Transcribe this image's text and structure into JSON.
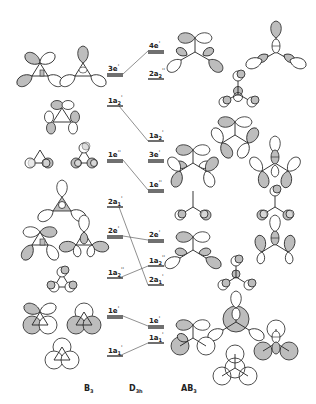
{
  "diagram": {
    "title": "",
    "column_labels": {
      "left": "B3",
      "middle": "D3h",
      "right": "AB3"
    },
    "left_levels": [
      {
        "id": "B3-3e'",
        "label": "3e'",
        "sym": "3e",
        "prime": "'",
        "degenerate": true,
        "y": 74
      },
      {
        "id": "B3-1a2'",
        "label": "1a2'",
        "sym": "1a",
        "sub": "2",
        "prime": "'",
        "degenerate": false,
        "y": 106
      },
      {
        "id": "B3-1e''",
        "label": "1e''",
        "sym": "1e",
        "prime": "''",
        "degenerate": true,
        "y": 160
      },
      {
        "id": "B3-2a1'",
        "label": "2a1'",
        "sym": "2a",
        "sub": "1",
        "prime": "'",
        "degenerate": false,
        "y": 207
      },
      {
        "id": "B3-2e'",
        "label": "2e'",
        "sym": "2e",
        "prime": "'",
        "degenerate": true,
        "y": 236
      },
      {
        "id": "B3-1a2''",
        "label": "1a2''",
        "sym": "1a",
        "sub": "2",
        "prime": "''",
        "degenerate": false,
        "y": 278
      },
      {
        "id": "B3-1e'",
        "label": "1e'",
        "sym": "1e",
        "prime": "'",
        "degenerate": true,
        "y": 316
      },
      {
        "id": "B3-1a1'",
        "label": "1a1'",
        "sym": "1a",
        "sub": "1",
        "prime": "'",
        "degenerate": false,
        "y": 356
      }
    ],
    "right_levels": [
      {
        "id": "AB3-4e'",
        "label": "4e'",
        "sym": "4e",
        "prime": "'",
        "degenerate": true,
        "y": 51
      },
      {
        "id": "AB3-2a2''",
        "label": "2a2''",
        "sym": "2a",
        "sub": "2",
        "prime": "''",
        "degenerate": false,
        "y": 79
      },
      {
        "id": "AB3-1a2'",
        "label": "1a2'",
        "sym": "1a",
        "sub": "2",
        "prime": "'",
        "degenerate": false,
        "y": 141
      },
      {
        "id": "AB3-3e'",
        "label": "3e'",
        "sym": "3e",
        "prime": "'",
        "degenerate": true,
        "y": 160
      },
      {
        "id": "AB3-1e''",
        "label": "1e''",
        "sym": "1e",
        "prime": "''",
        "degenerate": true,
        "y": 190
      },
      {
        "id": "AB3-2e'",
        "label": "2e'",
        "sym": "2e",
        "prime": "'",
        "degenerate": true,
        "y": 240
      },
      {
        "id": "AB3-1a2''",
        "label": "1a2''",
        "sym": "1a",
        "sub": "2",
        "prime": "''",
        "degenerate": false,
        "y": 266
      },
      {
        "id": "AB3-2a1'",
        "label": "2a1'",
        "sym": "2a",
        "sub": "1",
        "prime": "'",
        "degenerate": false,
        "y": 285
      },
      {
        "id": "AB3-1e'",
        "label": "1e'",
        "sym": "1e",
        "prime": "'",
        "degenerate": true,
        "y": 326
      },
      {
        "id": "AB3-1a1'",
        "label": "1a1'",
        "sym": "1a",
        "sub": "1",
        "prime": "'",
        "degenerate": false,
        "y": 343
      }
    ],
    "correlations": [
      {
        "from": "B3-3e'",
        "to": "AB3-4e'"
      },
      {
        "from": "B3-1a2'",
        "to": "AB3-1a2'"
      },
      {
        "from": "B3-1e''",
        "to": "AB3-1e''"
      },
      {
        "from": "B3-2a1'",
        "to": "AB3-2a1'"
      },
      {
        "from": "B3-2e'",
        "to": "AB3-2e'"
      },
      {
        "from": "B3-1a2''",
        "to": "AB3-1a2''"
      },
      {
        "from": "B3-1e'",
        "to": "AB3-1e'"
      },
      {
        "from": "B3-1a1'",
        "to": "AB3-1a1'"
      }
    ],
    "colors": {
      "line": "#222222",
      "shaded_lobe": "#bdbdbd",
      "background": "#ffffff"
    }
  }
}
